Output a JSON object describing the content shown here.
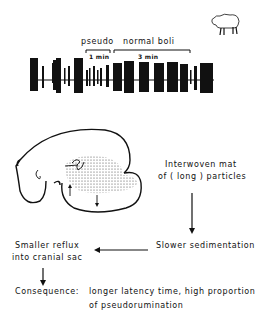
{
  "trace": {
    "label_pseudo": "pseudo",
    "label_normal": "normal  boli",
    "bracket_pseudo_duration": "1 min",
    "bracket_normal_duration": "3 min",
    "icon": "sheep-icon"
  },
  "flow": {
    "box_mat_line1": "Interwoven  mat",
    "box_mat_line2": "of  ( long )  particles",
    "box_sedimentation": "Slower  sedimentation",
    "box_reflux_line1": "Smaller  reflux",
    "box_reflux_line2": "into  cranial  sac",
    "consequence_label": "Consequence:",
    "consequence_line1": "longer  latency  time, high  proportion",
    "consequence_line2": "of  pseudorumination"
  },
  "diagram": {
    "type": "flowchart",
    "nodes": [
      "Interwoven mat of (long) particles",
      "Slower sedimentation",
      "Smaller reflux into cranial sac",
      "Consequence: longer latency time, high proportion of pseudorumination"
    ],
    "edges": [
      [
        "Interwoven mat of (long) particles",
        "Slower sedimentation"
      ],
      [
        "Slower sedimentation",
        "Smaller reflux into cranial sac"
      ],
      [
        "Smaller reflux into cranial sac",
        "Consequence"
      ]
    ]
  }
}
